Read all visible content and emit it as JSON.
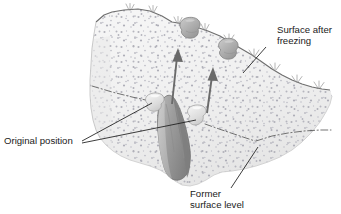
{
  "figure": {
    "labels": {
      "surface_after_freezing_line1": "Surface after",
      "surface_after_freezing_line2": "freezing",
      "original_position": "Original position",
      "former_surface_line1": "Former",
      "former_surface_line2": "surface level"
    },
    "colors": {
      "soil_fill": "#f2f2f2",
      "soil_edge": "#6e6e6e",
      "stipple": "#b0b0b8",
      "rock_dark": "#8e8e8e",
      "rock_mid": "#a9a9a9",
      "rock_light": "#c8c8c8",
      "ghost_fill": "#e4e4e4",
      "ghost_edge": "#9a9a9a",
      "arrow": "#6a6a6a",
      "leader": "#1a1a1a",
      "dash_line": "#5a5a5a",
      "grass": "#8c8c8c",
      "text": "#1a1a1a",
      "background": "#ffffff"
    },
    "elements": {
      "surface_boulders_count": 2,
      "buried_boulder_count": 1,
      "ghost_boulder_count": 2,
      "heave_arrows_count": 2,
      "grass_tufts_count": 9
    },
    "annotations": [
      {
        "name": "surface-after-freezing",
        "target": "upper soil surface right slope"
      },
      {
        "name": "original-position",
        "target": "ghost outlines of boulders before heaving"
      },
      {
        "name": "former-surface-level",
        "target": "dash-dot line through soil block"
      }
    ]
  }
}
